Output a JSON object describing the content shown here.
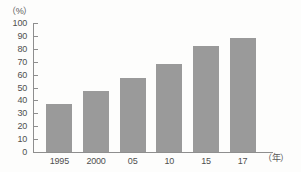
{
  "chart_data": {
    "type": "bar",
    "title": "",
    "xlabel": "（年）",
    "ylabel": "（%）",
    "categories": [
      "1995",
      "2000",
      "05",
      "10",
      "15",
      "17"
    ],
    "values": [
      37,
      47,
      57,
      68,
      82.5,
      88.5
    ],
    "ylim": [
      0,
      100
    ],
    "ytick_step": 10,
    "yticks": [
      "100",
      "90",
      "80",
      "70",
      "60",
      "50",
      "40",
      "30",
      "20",
      "10",
      "0"
    ],
    "grid": false,
    "legend": "none",
    "bar_color": "#9a9a9a",
    "axis_color": "#8e8e8e",
    "text_color": "#4f4f4f",
    "background": "#fdfdfc"
  }
}
